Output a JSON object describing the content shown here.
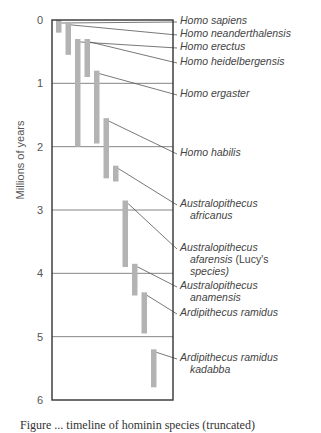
{
  "chart_data": {
    "type": "range-bar",
    "title": "",
    "ylabel": "Millions of years",
    "xlabel": "",
    "ylim": [
      0,
      6
    ],
    "y_inverted": true,
    "yticks": [
      "0",
      "1",
      "2",
      "3",
      "4",
      "5",
      "6"
    ],
    "grid": true,
    "series": [
      {
        "name": "Homo sapiens",
        "label_lines": [
          "Homo sapiens"
        ],
        "start": 0.0,
        "end": 0.2
      },
      {
        "name": "Homo neanderthalensis",
        "label_lines": [
          "Homo neanderthalensis"
        ],
        "start": 0.03,
        "end": 0.55
      },
      {
        "name": "Homo erectus",
        "label_lines": [
          "Homo erectus"
        ],
        "start": 0.3,
        "end": 2.0
      },
      {
        "name": "Homo heidelbergensis",
        "label_lines": [
          "Homo heidelbergensis"
        ],
        "start": 0.3,
        "end": 0.9
      },
      {
        "name": "Homo ergaster",
        "label_lines": [
          "Homo ergaster"
        ],
        "start": 0.8,
        "end": 1.95
      },
      {
        "name": "Homo habilis",
        "label_lines": [
          "Homo habilis"
        ],
        "start": 1.55,
        "end": 2.5
      },
      {
        "name": "Australopithecus africanus",
        "label_lines": [
          "Australopithecus",
          "africanus"
        ],
        "start": 2.3,
        "end": 2.55
      },
      {
        "name": "Australopithecus afarensis (Lucy's species)",
        "label_lines": [
          "Australopithecus",
          "afarensis (Lucy's",
          "species)"
        ],
        "start": 2.85,
        "end": 3.9
      },
      {
        "name": "Australopithecus anamensis",
        "label_lines": [
          "Australopithecus",
          "anamensis"
        ],
        "start": 3.85,
        "end": 4.35
      },
      {
        "name": "Ardipithecus ramidus",
        "label_lines": [
          "Ardipithecus ramidus"
        ],
        "start": 4.3,
        "end": 4.95
      },
      {
        "name": "Ardipithecus ramidus kadabba",
        "label_lines": [
          "Ardipithecus ramidus",
          "kadabba"
        ],
        "start": 5.2,
        "end": 5.8
      }
    ],
    "colors": {
      "bar": "#b3b3b3",
      "frame": "#333333",
      "gridline": "#666666",
      "leader": "#555555",
      "text": "#444444"
    }
  },
  "caption": "Figure ... timeline of hominin species (truncated)"
}
